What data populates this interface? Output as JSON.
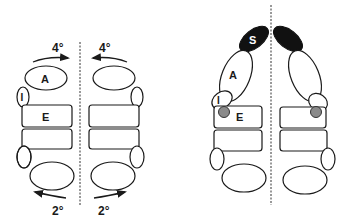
{
  "figure": {
    "left_panel": {
      "top_labels": {
        "left": "4°",
        "right": "4°"
      },
      "bottom_labels": {
        "left": "2°",
        "right": "2°"
      },
      "bone_labels": {
        "A": "A",
        "I": "I",
        "E": "E"
      },
      "top_arrows": {
        "left_direction": "toward-midline",
        "right_direction": "toward-midline"
      },
      "bottom_arrows": {
        "left_direction": "away-from-midline",
        "right_direction": "away-from-midline"
      }
    },
    "right_panel": {
      "bone_labels": {
        "S": "S",
        "A": "A",
        "I": "I",
        "E": "E"
      },
      "highlighted_bone": "S",
      "dot_marker": "gray"
    },
    "colors": {
      "stroke": "#1a1a1a",
      "fill": "#ffffff",
      "dark_fill": "#111111",
      "dot_fill": "#8a8a8a",
      "label_on_dark": "#ffffff"
    }
  }
}
